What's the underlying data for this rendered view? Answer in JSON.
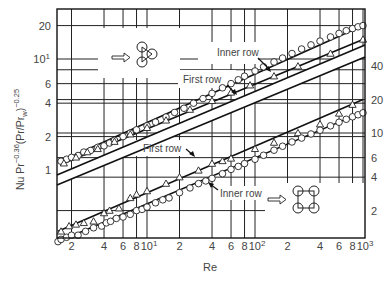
{
  "chart_data": {
    "type": "scatter",
    "title": "",
    "xlabel": "Re",
    "ylabel": "Nu Pr^-0.36 (Pr/Pr_w)^-0.25",
    "xscale": "log",
    "yscale": "log",
    "xlim": [
      1.47,
      1000
    ],
    "x_ticks": [
      "2",
      "4",
      "6",
      "8",
      "10^1",
      "2",
      "4",
      "6",
      "8",
      "10^2",
      "2",
      "4",
      "6",
      "8",
      "10^3"
    ],
    "x_tick_values": [
      2,
      4,
      6,
      8,
      10,
      20,
      40,
      60,
      80,
      100,
      200,
      400,
      600,
      800,
      1000
    ],
    "left_axis": {
      "applies_to": "upper panel (triangular tube arrangement)",
      "ticks": [
        "1",
        "2",
        "4",
        "6",
        "10^1",
        "20"
      ],
      "tick_values": [
        1,
        2,
        4,
        6,
        10,
        20
      ],
      "ylim": [
        0.94,
        26
      ]
    },
    "right_axis": {
      "applies_to": "lower panel (in-line square tube arrangement)",
      "ticks": [
        "2",
        "4",
        "6",
        "10",
        "20",
        "40"
      ],
      "tick_values": [
        2,
        4,
        6,
        10,
        20,
        40
      ]
    },
    "grid": true,
    "legend": "annotations",
    "panels": [
      {
        "name": "upper (triangular arrangement)",
        "icon": "three-tube-triangle",
        "series": [
          {
            "name": "Inner row",
            "marker": "circle",
            "x": [
              1.6,
              1.8,
              2.0,
              2.3,
              2.6,
              3.0,
              3.5,
              4.0,
              4.5,
              5,
              6,
              7,
              8,
              10,
              12,
              15,
              18,
              22,
              27,
              33,
              40,
              50,
              60,
              70,
              80,
              100,
              120,
              150,
              180,
              220,
              270,
              330,
              400,
              500,
              600,
              700,
              800,
              900,
              1000
            ],
            "y": [
              1.2,
              1.25,
              1.3,
              1.35,
              1.45,
              1.5,
              1.6,
              1.65,
              1.75,
              1.85,
              2.0,
              2.15,
              2.3,
              2.5,
              2.7,
              3.0,
              3.3,
              3.6,
              4.0,
              4.4,
              4.9,
              5.5,
              6.0,
              6.5,
              7.0,
              7.8,
              8.5,
              9.4,
              10.2,
              11.2,
              12.3,
              13.4,
              14.5,
              15.8,
              17.0,
              18.0,
              18.8,
              19.5,
              20.0
            ]
          },
          {
            "name": "First row",
            "marker": "triangle",
            "x": [
              1.7,
              2.2,
              2.8,
              3.5,
              5,
              7,
              10,
              15,
              25,
              40,
              60,
              90,
              150,
              250,
              500,
              1000
            ],
            "y": [
              1.15,
              1.3,
              1.45,
              1.55,
              1.8,
              2.1,
              2.4,
              2.8,
              3.5,
              4.2,
              5.0,
              5.8,
              7.0,
              8.6,
              11.2,
              15.0
            ]
          }
        ],
        "fit_lines": [
          {
            "name": "Inner row",
            "from": [
              1.6,
              1.2
            ],
            "to": [
              1000,
              20
            ]
          },
          {
            "name": "First row",
            "from": [
              1.6,
              1.12
            ],
            "to": [
              1000,
              15
            ]
          }
        ]
      },
      {
        "name": "lower (in-line square arrangement)",
        "icon": "four-tube-square",
        "series": [
          {
            "name": "First row",
            "marker": "triangle",
            "x": [
              1.6,
              1.9,
              2.2,
              2.6,
              3.2,
              4.0,
              4.5,
              5.5,
              7,
              8,
              10,
              15,
              20,
              30,
              40,
              50,
              60,
              100,
              150,
              250,
              400,
              600,
              800
            ],
            "y": [
              1.3,
              1.45,
              1.5,
              1.55,
              1.6,
              1.9,
              2.0,
              2.1,
              2.6,
              2.8,
              3.0,
              3.5,
              4.0,
              4.6,
              5.3,
              5.6,
              5.9,
              7.2,
              8.2,
              10.0,
              12.0,
              15.0,
              18.0
            ]
          },
          {
            "name": "Inner row",
            "marker": "circle",
            "x": [
              1.5,
              1.6,
              1.8,
              2.0,
              2.3,
              2.7,
              3.2,
              3.8,
              4.2,
              4.6,
              5.2,
              6,
              7,
              8,
              9,
              10,
              12,
              14,
              16,
              20,
              25,
              30,
              35,
              40,
              50,
              60,
              70,
              80,
              100,
              120,
              150,
              180,
              220,
              270,
              330,
              400,
              500,
              600,
              700,
              800,
              900,
              1000
            ],
            "y": [
              1.05,
              1.1,
              1.15,
              1.2,
              1.2,
              1.3,
              1.4,
              1.45,
              1.55,
              1.6,
              1.7,
              1.75,
              1.85,
              2.0,
              2.05,
              2.15,
              2.35,
              2.5,
              2.6,
              2.9,
              3.2,
              3.5,
              3.7,
              3.9,
              4.3,
              4.7,
              5.0,
              5.3,
              5.8,
              6.3,
              7.0,
              7.6,
              8.3,
              9.0,
              9.8,
              10.6,
              11.6,
              12.5,
              13.3,
              14.0,
              14.6,
              15.2
            ]
          }
        ],
        "fit_lines": [
          {
            "name": "First row",
            "from": [
              1.5,
              1.3
            ],
            "to": [
              1000,
              20
            ]
          },
          {
            "name": "Inner row",
            "from": [
              1.5,
              1.05
            ],
            "to": [
              1000,
              15.5
            ]
          }
        ]
      }
    ],
    "annotations": [
      {
        "text": "Inner row",
        "panel": "upper"
      },
      {
        "text": "First row",
        "panel": "upper"
      },
      {
        "text": "First row",
        "panel": "lower"
      },
      {
        "text": "Inner row",
        "panel": "lower"
      }
    ]
  },
  "labels": {
    "xlabel": "Re",
    "ylabel_main": "Nu Pr",
    "ylabel_exp1": "−0.36",
    "ylabel_mid": "(Pr/Pr",
    "ylabel_sub": "w",
    "ylabel_close": ")",
    "ylabel_exp2": "−0.25",
    "upper_inner": "Inner row",
    "upper_first": "First row",
    "lower_first": "First row",
    "lower_inner": "Inner row",
    "left_ticks": [
      {
        "label": "20",
        "exp": ""
      },
      {
        "label": "10",
        "exp": "1"
      },
      {
        "label": "6",
        "exp": ""
      },
      {
        "label": "4",
        "exp": ""
      },
      {
        "label": "2",
        "exp": ""
      },
      {
        "label": "1",
        "exp": ""
      }
    ],
    "right_ticks": [
      "40",
      "20",
      "10",
      "6",
      "4",
      "2"
    ],
    "x_ticks": [
      {
        "label": "2",
        "exp": ""
      },
      {
        "label": "4",
        "exp": ""
      },
      {
        "label": "6",
        "exp": ""
      },
      {
        "label": "8",
        "exp": ""
      },
      {
        "label": "10",
        "exp": "1"
      },
      {
        "label": "2",
        "exp": ""
      },
      {
        "label": "4",
        "exp": ""
      },
      {
        "label": "6",
        "exp": ""
      },
      {
        "label": "8",
        "exp": ""
      },
      {
        "label": "10",
        "exp": "2"
      },
      {
        "label": "2",
        "exp": ""
      },
      {
        "label": "4",
        "exp": ""
      },
      {
        "label": "6",
        "exp": ""
      },
      {
        "label": "8",
        "exp": ""
      },
      {
        "label": "10",
        "exp": "3"
      }
    ]
  }
}
